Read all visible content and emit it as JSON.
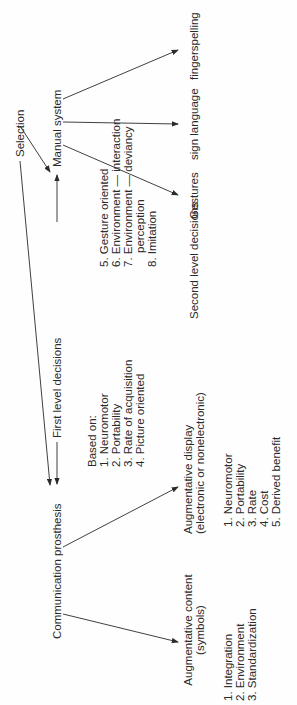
{
  "diagram": {
    "root": "Selection",
    "first_level_label": "First level decisions",
    "second_level_label": "Second level decisions",
    "left_branch": {
      "label": "Communication prosthesis",
      "children": [
        {
          "label_line1": "Augmentative content",
          "label_line2": "(symbols)",
          "criteria": [
            "1. Integration",
            "2. Environment",
            "3. Standardization"
          ]
        },
        {
          "label_line1": "Augmentative display",
          "label_line2": "(electronic or nonelectronic)",
          "criteria": [
            "1. Neuromotor",
            "2. Portability",
            "3. Rate",
            "4. Cost",
            "5. Derived benefit"
          ]
        }
      ]
    },
    "right_branch": {
      "label": "Manual system",
      "children": [
        "Gestures",
        "sign language",
        "fingerspelling"
      ]
    },
    "based_on": {
      "heading": "Based on:",
      "items_left": [
        "1. Neuromotor",
        "2. Portability",
        "3. Rate of acquisition",
        "4. Picture oriented"
      ],
      "items_right": [
        "5. Gesture oriented",
        "6. Environment — interaction",
        "7. Environment — deviancy",
        "perception",
        "8. Imitation"
      ]
    }
  }
}
